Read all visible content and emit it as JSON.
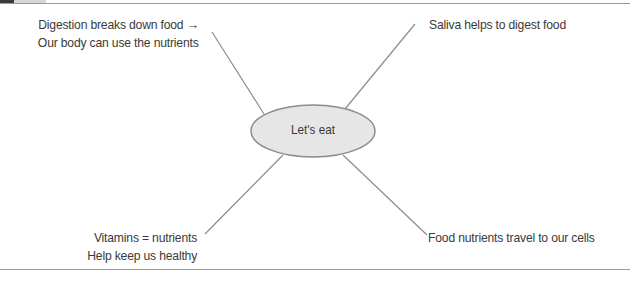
{
  "diagram": {
    "type": "mind-map",
    "center": {
      "label": "Let's eat",
      "fill": "#e6e6e6",
      "stroke": "#8c8c8c"
    },
    "branches": [
      {
        "position": "top-left",
        "lines": [
          "Digestion breaks down food →",
          "Our body can use the nutrients"
        ]
      },
      {
        "position": "top-right",
        "lines": [
          "Saliva helps to digest food"
        ]
      },
      {
        "position": "bottom-left",
        "lines": [
          "Vitamins = nutrients",
          "Help keep us healthy"
        ]
      },
      {
        "position": "bottom-right",
        "lines": [
          "Food nutrients travel to our cells"
        ]
      }
    ],
    "line_color": "#8c8c8c",
    "rule_color": "#9a9a9a"
  }
}
